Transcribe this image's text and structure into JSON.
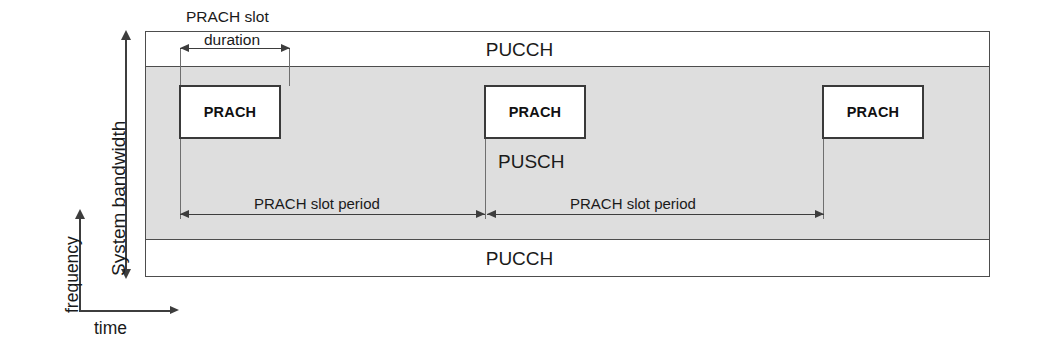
{
  "diagram": {
    "title_axes": {
      "y_axis_label": "frequency",
      "x_axis_label": "time",
      "bandwidth_label": "System bandwidth"
    },
    "bands": [
      {
        "name": "pucch-top",
        "label": "PUCCH",
        "fill": "#ffffff"
      },
      {
        "name": "pusch",
        "label": "PUSCH",
        "fill": "#dedede"
      },
      {
        "name": "pucch-bottom",
        "label": "PUCCH",
        "fill": "#ffffff"
      }
    ],
    "prach_boxes": [
      {
        "label": "PRACH"
      },
      {
        "label": "PRACH"
      },
      {
        "label": "PRACH"
      }
    ],
    "dimensions": {
      "slot_duration_line1": "PRACH slot",
      "slot_duration_line2": "duration",
      "slot_period_1": "PRACH slot period",
      "slot_period_2": "PRACH slot period"
    },
    "colors": {
      "shaded_fill": "#dedede",
      "stroke": "#4d4d4d",
      "box_stroke": "#3a3a3a",
      "text": "#1a1a1a"
    }
  }
}
